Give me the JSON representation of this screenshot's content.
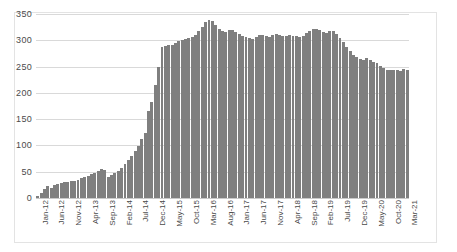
{
  "chart_data": {
    "type": "bar",
    "title": "",
    "xlabel": "",
    "ylabel": "",
    "ylim": [
      0,
      350
    ],
    "yticks": [
      0,
      50,
      100,
      150,
      200,
      250,
      300,
      350
    ],
    "grid": true,
    "legend": false,
    "bar_color": "#7f7f7f",
    "gridline_color": "#d9d9d9",
    "xtick_interval_months": 5,
    "xtick_labels": [
      "Jan-12",
      "Jun-12",
      "Nov-12",
      "Apr-13",
      "Sep-13",
      "Feb-14",
      "Jul-14",
      "Dec-14",
      "May-15",
      "Oct-15",
      "Mar-16",
      "Aug-16",
      "Jan-17",
      "Jun-17",
      "Nov-17",
      "Apr-18",
      "Sep-18",
      "Feb-19",
      "Jul-19",
      "Dec-19",
      "May-20",
      "Oct-20",
      "Mar-21"
    ],
    "categories": [
      "Jan-12",
      "Feb-12",
      "Mar-12",
      "Apr-12",
      "May-12",
      "Jun-12",
      "Jul-12",
      "Aug-12",
      "Sep-12",
      "Oct-12",
      "Nov-12",
      "Dec-12",
      "Jan-13",
      "Feb-13",
      "Mar-13",
      "Apr-13",
      "May-13",
      "Jun-13",
      "Jul-13",
      "Aug-13",
      "Sep-13",
      "Oct-13",
      "Nov-13",
      "Dec-13",
      "Jan-14",
      "Feb-14",
      "Mar-14",
      "Apr-14",
      "May-14",
      "Jun-14",
      "Jul-14",
      "Aug-14",
      "Sep-14",
      "Oct-14",
      "Nov-14",
      "Dec-14",
      "Jan-15",
      "Feb-15",
      "Mar-15",
      "Apr-15",
      "May-15",
      "Jun-15",
      "Jul-15",
      "Aug-15",
      "Sep-15",
      "Oct-15",
      "Nov-15",
      "Dec-15",
      "Jan-16",
      "Feb-16",
      "Mar-16",
      "Apr-16",
      "May-16",
      "Jun-16",
      "Jul-16",
      "Aug-16",
      "Sep-16",
      "Oct-16",
      "Nov-16",
      "Dec-16",
      "Jan-17",
      "Feb-17",
      "Mar-17",
      "Apr-17",
      "May-17",
      "Jun-17",
      "Jul-17",
      "Aug-17",
      "Sep-17",
      "Oct-17",
      "Nov-17",
      "Dec-17",
      "Jan-18",
      "Feb-18",
      "Mar-18",
      "Apr-18",
      "May-18",
      "Jun-18",
      "Jul-18",
      "Aug-18",
      "Sep-18",
      "Oct-18",
      "Nov-18",
      "Dec-18",
      "Jan-19",
      "Feb-19",
      "Mar-19",
      "Apr-19",
      "May-19",
      "Jun-19",
      "Jul-19",
      "Aug-19",
      "Sep-19",
      "Oct-19",
      "Nov-19",
      "Dec-19",
      "Jan-20",
      "Feb-20",
      "Mar-20",
      "Apr-20",
      "May-20",
      "Jun-20",
      "Jul-20",
      "Aug-20",
      "Sep-20",
      "Oct-20",
      "Nov-20",
      "Dec-20",
      "Jan-21",
      "Feb-21",
      "Mar-21"
    ],
    "values": [
      3,
      10,
      18,
      22,
      20,
      24,
      26,
      28,
      30,
      30,
      32,
      33,
      35,
      38,
      40,
      42,
      45,
      48,
      52,
      55,
      53,
      40,
      44,
      48,
      52,
      58,
      65,
      72,
      80,
      90,
      98,
      112,
      124,
      166,
      183,
      215,
      249,
      288,
      290,
      291,
      292,
      295,
      298,
      300,
      302,
      304,
      306,
      310,
      318,
      326,
      334,
      338,
      336,
      330,
      322,
      318,
      316,
      319,
      320,
      316,
      312,
      309,
      307,
      305,
      303,
      306,
      310,
      311,
      308,
      306,
      310,
      312,
      311,
      309,
      308,
      310,
      309,
      308,
      307,
      309,
      313,
      318,
      321,
      322,
      320,
      316,
      313,
      318,
      317,
      312,
      305,
      296,
      288,
      280,
      272,
      268,
      265,
      262,
      266,
      263,
      258,
      256,
      252,
      248,
      244,
      243,
      244,
      243,
      242,
      246,
      244
    ]
  }
}
